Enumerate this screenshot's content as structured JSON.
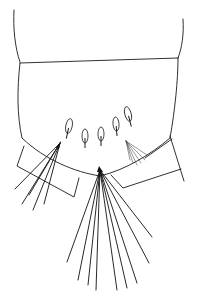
{
  "figure": {
    "type": "biological line drawing",
    "stroke_color": "#1a1a1a",
    "background": "#ffffff",
    "structures": {
      "upper_segment": "tergite",
      "lower_segment": "terminal segment",
      "left_appendage": "lateral lobe",
      "right_appendage": "lateral lobe",
      "spines_count": 5,
      "setae_fans": [
        {
          "name": "left-fan",
          "count": 5
        },
        {
          "name": "central-fan",
          "count": 9
        },
        {
          "name": "right-fan",
          "count": 6
        }
      ]
    }
  }
}
